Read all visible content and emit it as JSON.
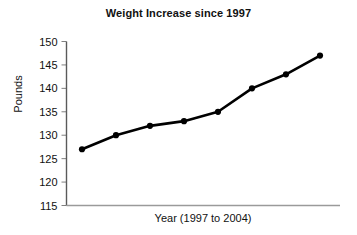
{
  "chart_data": {
    "type": "line",
    "title": "Weight Increase since 1997",
    "xlabel": "Year (1997 to 2004)",
    "ylabel": "Pounds",
    "x": [
      1997,
      1998,
      1999,
      2000,
      2001,
      2002,
      2003,
      2004
    ],
    "categories": [
      "1997",
      "1998",
      "1999",
      "2000",
      "2001",
      "2002",
      "2003",
      "2004"
    ],
    "values": [
      127,
      130,
      132,
      133,
      135,
      140,
      143,
      147
    ],
    "series": [
      {
        "name": "Weight",
        "values": [
          127,
          130,
          132,
          133,
          135,
          140,
          143,
          147
        ]
      }
    ],
    "ylim": [
      115,
      150
    ],
    "yticks": [
      115,
      120,
      125,
      130,
      135,
      140,
      145,
      150
    ],
    "ytick_labels": [
      "115",
      "120",
      "125",
      "130",
      "135",
      "140",
      "145",
      "150"
    ],
    "xticks": [],
    "xtick_labels": [],
    "grid": false,
    "legend": false,
    "legend_position": "none",
    "line_color": "#000000",
    "marker": "circle",
    "marker_color": "#000000",
    "axis_color": "#808080",
    "background_color": "#ffffff"
  }
}
